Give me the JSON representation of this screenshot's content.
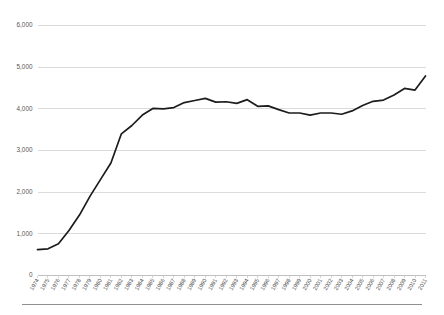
{
  "chart_data": {
    "type": "line",
    "title": "",
    "subtitle": "",
    "xlabel": "",
    "ylabel": "",
    "grid": true,
    "legend": false,
    "legend_position": "none",
    "line_color": "#1c1c1c",
    "gridline_color": "#d2d2d2",
    "background_color": "#ffffff",
    "ylim": [
      0,
      6000
    ],
    "ytick_labels": [
      "0",
      "1,000",
      "2,000",
      "3,000",
      "4,000",
      "5,000",
      "6,000"
    ],
    "ytick_values": [
      0,
      1000,
      2000,
      3000,
      4000,
      5000,
      6000
    ],
    "categories": [
      "1974",
      "1975",
      "1976",
      "1977",
      "1978",
      "1979",
      "1980",
      "1981",
      "1982",
      "1983",
      "1984",
      "1985",
      "1986",
      "1987",
      "1988",
      "1989",
      "1990",
      "1991",
      "1992",
      "1993",
      "1994",
      "1995",
      "1996",
      "1997",
      "1998",
      "1999",
      "2000",
      "2001",
      "2002",
      "2003",
      "2004",
      "2005",
      "2006",
      "2007",
      "2008",
      "2009",
      "2010",
      "2011"
    ],
    "series": [
      {
        "name": "Series 1",
        "values": [
          620,
          640,
          760,
          1080,
          1450,
          1900,
          2300,
          2700,
          3400,
          3600,
          3850,
          4010,
          4000,
          4030,
          4150,
          4200,
          4250,
          4160,
          4170,
          4130,
          4220,
          4060,
          4070,
          3980,
          3900,
          3900,
          3850,
          3900,
          3900,
          3870,
          3950,
          4080,
          4180,
          4210,
          4330,
          4490,
          4450,
          4790
        ]
      }
    ]
  }
}
